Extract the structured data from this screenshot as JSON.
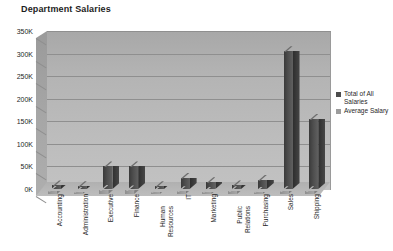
{
  "chart_data": {
    "type": "bar",
    "title": "Department Salaries",
    "xlabel": "",
    "ylabel": "",
    "ylim": [
      0,
      350000
    ],
    "ytick_labels": [
      "350K",
      "300K",
      "250K",
      "200K",
      "150K",
      "100K",
      "50K",
      "0K"
    ],
    "ytick_values": [
      350000,
      300000,
      250000,
      200000,
      150000,
      100000,
      50000,
      0
    ],
    "grid": true,
    "legend_position": "right",
    "categories": [
      "Accounting",
      "Administration",
      "Executive",
      "Finance",
      "Human Resources",
      "IT",
      "Marketing",
      "Public Relations",
      "Purchasing",
      "Sales",
      "Shipping"
    ],
    "series": [
      {
        "name": "Total of All Salaries",
        "color": "#4d4d4d",
        "values": [
          8000,
          6000,
          50000,
          50000,
          6000,
          25000,
          15000,
          8000,
          20000,
          305000,
          155000
        ]
      },
      {
        "name": "Average Salary",
        "color": "#9c9c9c",
        "values": [
          7000,
          5000,
          9000,
          8000,
          5000,
          6000,
          5000,
          6000,
          5000,
          6000,
          6000
        ]
      }
    ]
  },
  "legend": {
    "items": [
      {
        "label": "Total of All Salaries"
      },
      {
        "label": "Average Salary"
      }
    ]
  }
}
